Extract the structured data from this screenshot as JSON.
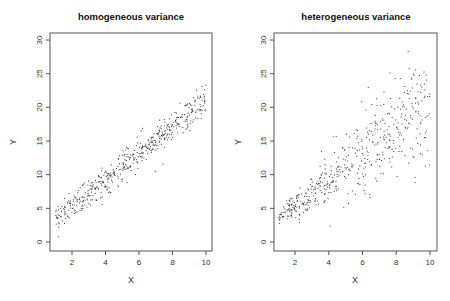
{
  "chart_data": [
    {
      "type": "scatter",
      "title": "homogeneous variance",
      "xlabel": "X",
      "ylabel": "Y",
      "xlim": [
        1,
        10
      ],
      "ylim": [
        0,
        30
      ],
      "xticks": [
        2,
        4,
        6,
        8,
        10
      ],
      "yticks": [
        0,
        5,
        10,
        15,
        20,
        25,
        30
      ],
      "grid": false,
      "n_points": 500,
      "model": {
        "intercept": 1.5,
        "slope": 1.95,
        "noise_sd": 1.1,
        "noise_type": "constant"
      },
      "sample_points": [
        [
          1.1,
          2.0
        ],
        [
          1.5,
          4.0
        ],
        [
          2,
          4.5
        ],
        [
          3,
          6.8
        ],
        [
          4,
          9.0
        ],
        [
          5,
          10.5
        ],
        [
          6,
          12.8
        ],
        [
          7,
          14.8
        ],
        [
          8,
          16.8
        ],
        [
          9,
          18.5
        ],
        [
          10,
          21.0
        ]
      ]
    },
    {
      "type": "scatter",
      "title": "heterogeneous variance",
      "xlabel": "X",
      "ylabel": "Y",
      "xlim": [
        1,
        10
      ],
      "ylim": [
        0,
        30
      ],
      "xticks": [
        2,
        4,
        6,
        8,
        10
      ],
      "yticks": [
        0,
        5,
        10,
        15,
        20,
        25,
        30
      ],
      "grid": false,
      "n_points": 500,
      "model": {
        "intercept": 1.5,
        "slope": 1.95,
        "noise_sd_per_x": 0.45,
        "noise_type": "proportional"
      },
      "sample_points": [
        [
          1.1,
          3.0
        ],
        [
          2,
          4.8
        ],
        [
          3,
          7.0
        ],
        [
          4,
          9.0
        ],
        [
          5,
          11.0
        ],
        [
          6,
          13.0
        ],
        [
          7,
          15.0
        ],
        [
          8,
          17.0
        ],
        [
          9,
          19.0
        ],
        [
          10,
          21.0
        ],
        [
          9.8,
          29.5
        ]
      ]
    }
  ],
  "panels": [
    {
      "title": "homogeneous variance",
      "xlabel": "X",
      "ylabel": "Y"
    },
    {
      "title": "heterogeneous variance",
      "xlabel": "X",
      "ylabel": "Y"
    }
  ],
  "colors": {
    "points": "#333333",
    "axes": "#555555",
    "background": "#ffffff"
  }
}
